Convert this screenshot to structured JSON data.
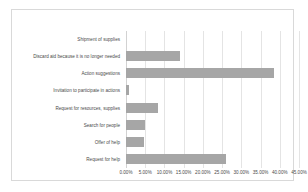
{
  "chart_data": {
    "type": "bar",
    "orientation": "horizontal",
    "title": "",
    "xlabel": "",
    "ylabel": "",
    "grid": true,
    "legend": false,
    "xlim": [
      0,
      45
    ],
    "xtick_labels": [
      "0.00%",
      "5.00%",
      "10.00%",
      "15.00%",
      "20.00%",
      "25.00%",
      "30.00%",
      "35.00%",
      "40.00%",
      "45.00%"
    ],
    "xtick_values": [
      0,
      5,
      10,
      15,
      20,
      25,
      30,
      35,
      40,
      45
    ],
    "bar_color": "#a6a6a6",
    "categories": [
      "Shipment of supplies",
      "Discard aid because it is no longer needed",
      "Action suggestions",
      "Invitation to participate in actions",
      "Request for resources, supplies",
      "Search for people",
      "Offer of help",
      "Request for help"
    ],
    "values": [
      0,
      14.0,
      38.5,
      0.8,
      8.2,
      5.0,
      4.6,
      26.0
    ]
  }
}
